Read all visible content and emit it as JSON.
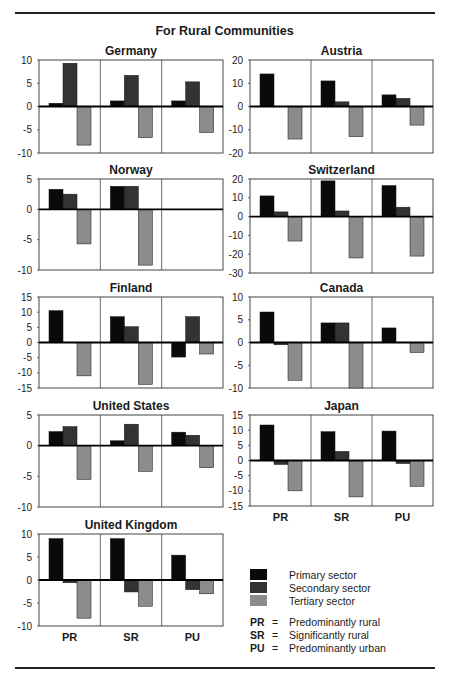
{
  "title": "For Rural Communities",
  "colors": {
    "primary": "#0a0a0a",
    "secondary": "#333333",
    "tertiary": "#8c8c8c",
    "frame": "#444444"
  },
  "legend": {
    "sectors": [
      {
        "key": "primary",
        "label": "Primary sector"
      },
      {
        "key": "secondary",
        "label": "Secondary sector"
      },
      {
        "key": "tertiary",
        "label": "Tertiary sector"
      }
    ],
    "abbreviations": [
      {
        "abbr": "PR",
        "eq": "=",
        "label": "Predominantly rural"
      },
      {
        "abbr": "SR",
        "eq": "=",
        "label": "Significantly rural"
      },
      {
        "abbr": "PU",
        "eq": "=",
        "label": "Predominantly urban"
      }
    ]
  },
  "chart_data": [
    {
      "type": "bar",
      "title": "Germany",
      "categories": [
        "PR",
        "SR",
        "PU"
      ],
      "ylim": [
        -10,
        10
      ],
      "yticks": [
        10,
        5,
        0,
        -5,
        -10
      ],
      "series": [
        {
          "name": "Primary sector",
          "values": [
            0.7,
            1.2,
            1.2
          ]
        },
        {
          "name": "Secondary sector",
          "values": [
            9.3,
            6.7,
            5.3
          ]
        },
        {
          "name": "Tertiary sector",
          "values": [
            -8.3,
            -6.7,
            -5.6
          ]
        }
      ]
    },
    {
      "type": "bar",
      "title": "Austria",
      "categories": [
        "PR",
        "SR",
        "PU"
      ],
      "ylim": [
        -20,
        20
      ],
      "yticks": [
        20,
        10,
        0,
        -10,
        -20
      ],
      "series": [
        {
          "name": "Primary sector",
          "values": [
            14,
            11,
            5
          ]
        },
        {
          "name": "Secondary sector",
          "values": [
            0,
            2,
            3.5
          ]
        },
        {
          "name": "Tertiary sector",
          "values": [
            -14,
            -13,
            -8
          ]
        }
      ]
    },
    {
      "type": "bar",
      "title": "Norway",
      "categories": [
        "PR",
        "SR",
        "PU"
      ],
      "ylim": [
        -10,
        5
      ],
      "yticks": [
        5,
        0,
        -5,
        -10
      ],
      "series": [
        {
          "name": "Primary sector",
          "values": [
            3.3,
            3.8,
            null
          ]
        },
        {
          "name": "Secondary sector",
          "values": [
            2.5,
            3.8,
            null
          ]
        },
        {
          "name": "Tertiary sector",
          "values": [
            -5.7,
            -9.2,
            null
          ]
        }
      ]
    },
    {
      "type": "bar",
      "title": "Switzerland",
      "categories": [
        "PR",
        "SR",
        "PU"
      ],
      "ylim": [
        -30,
        20
      ],
      "yticks": [
        20,
        10,
        0,
        -10,
        -20,
        -30
      ],
      "series": [
        {
          "name": "Primary sector",
          "values": [
            11,
            19,
            16.5
          ]
        },
        {
          "name": "Secondary sector",
          "values": [
            2.5,
            3,
            5
          ]
        },
        {
          "name": "Tertiary sector",
          "values": [
            -13,
            -22,
            -21
          ]
        }
      ]
    },
    {
      "type": "bar",
      "title": "Finland",
      "categories": [
        "PR",
        "SR",
        "PU"
      ],
      "ylim": [
        -15,
        15
      ],
      "yticks": [
        15,
        10,
        5,
        0,
        -5,
        -10,
        -15
      ],
      "series": [
        {
          "name": "Primary sector",
          "values": [
            10.5,
            8.5,
            -4.8
          ]
        },
        {
          "name": "Secondary sector",
          "values": [
            0,
            5.2,
            8.5
          ]
        },
        {
          "name": "Tertiary sector",
          "values": [
            -11,
            -13.8,
            -3.8
          ]
        }
      ]
    },
    {
      "type": "bar",
      "title": "Canada",
      "categories": [
        "PR",
        "SR",
        "PU"
      ],
      "ylim": [
        -10,
        10
      ],
      "yticks": [
        10,
        5,
        0,
        -5,
        -10
      ],
      "series": [
        {
          "name": "Primary sector",
          "values": [
            6.7,
            4.3,
            3.2
          ]
        },
        {
          "name": "Secondary sector",
          "values": [
            -0.5,
            4.3,
            0
          ]
        },
        {
          "name": "Tertiary sector",
          "values": [
            -8.3,
            -10,
            -2.2
          ]
        }
      ]
    },
    {
      "type": "bar",
      "title": "United States",
      "categories": [
        "PR",
        "SR",
        "PU"
      ],
      "ylim": [
        -10,
        5
      ],
      "yticks": [
        5,
        0,
        -5,
        -10
      ],
      "series": [
        {
          "name": "Primary sector",
          "values": [
            2.3,
            0.8,
            2.2
          ]
        },
        {
          "name": "Secondary sector",
          "values": [
            3.1,
            3.5,
            1.7
          ]
        },
        {
          "name": "Tertiary sector",
          "values": [
            -5.5,
            -4.2,
            -3.6
          ]
        }
      ]
    },
    {
      "type": "bar",
      "title": "Japan",
      "categories": [
        "PR",
        "SR",
        "PU"
      ],
      "ylim": [
        -15,
        15
      ],
      "yticks": [
        15,
        10,
        5,
        0,
        -5,
        -10,
        -15
      ],
      "series": [
        {
          "name": "Primary sector",
          "values": [
            11.7,
            9.5,
            9.7
          ]
        },
        {
          "name": "Secondary sector",
          "values": [
            -1.3,
            3,
            -1
          ]
        },
        {
          "name": "Tertiary sector",
          "values": [
            -10,
            -12,
            -8.5
          ]
        }
      ]
    },
    {
      "type": "bar",
      "title": "United Kingdom",
      "categories": [
        "PR",
        "SR",
        "PU"
      ],
      "ylim": [
        -10,
        10
      ],
      "yticks": [
        10,
        5,
        0,
        -5,
        -10
      ],
      "series": [
        {
          "name": "Primary sector",
          "values": [
            9,
            9,
            5.4
          ]
        },
        {
          "name": "Secondary sector",
          "values": [
            -0.6,
            -2.6,
            -2.1
          ]
        },
        {
          "name": "Tertiary sector",
          "values": [
            -8.3,
            -5.7,
            -3
          ]
        }
      ]
    }
  ],
  "layout": [
    {
      "x": 39,
      "y": 60,
      "w": 184,
      "h": 93,
      "xlabels": false
    },
    {
      "x": 250,
      "y": 60,
      "w": 183,
      "h": 93,
      "xlabels": false
    },
    {
      "x": 39,
      "y": 179,
      "w": 184,
      "h": 91,
      "xlabels": false
    },
    {
      "x": 250,
      "y": 179,
      "w": 183,
      "h": 94,
      "xlabels": false
    },
    {
      "x": 39,
      "y": 297,
      "w": 184,
      "h": 91,
      "xlabels": false
    },
    {
      "x": 250,
      "y": 297,
      "w": 183,
      "h": 91,
      "xlabels": false
    },
    {
      "x": 39,
      "y": 415,
      "w": 184,
      "h": 92,
      "xlabels": false
    },
    {
      "x": 250,
      "y": 415,
      "w": 183,
      "h": 91,
      "xlabels": true
    },
    {
      "x": 39,
      "y": 534,
      "w": 184,
      "h": 92,
      "xlabels": true
    }
  ]
}
